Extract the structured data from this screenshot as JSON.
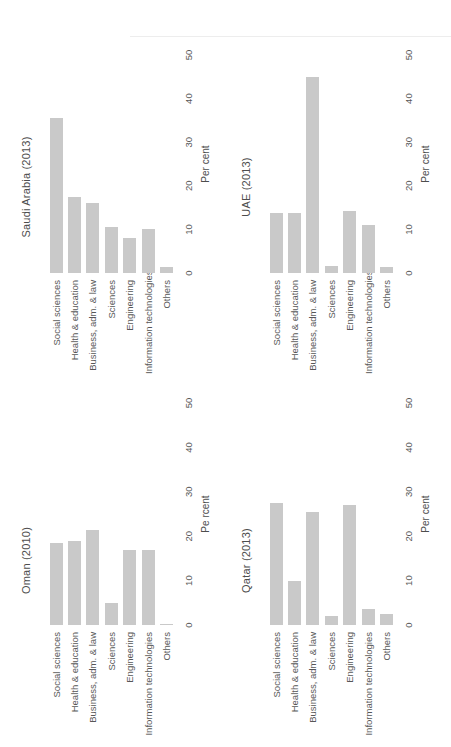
{
  "figure": {
    "bar_color": "#c9c9c9",
    "text_color": "#4d4d4d",
    "categories": [
      "Social sciences",
      "Health & education",
      "Business, adm. & law",
      "Sciences",
      "Engineering",
      "Information technologies",
      "Others"
    ]
  },
  "chart_data": [
    {
      "type": "bar",
      "orientation": "horizontal",
      "title": "Oman (2010)",
      "categories": [
        "Social sciences",
        "Health & education",
        "Business, adm. & law",
        "Sciences",
        "Engineering",
        "Information technologies",
        "Others"
      ],
      "values": [
        18.5,
        19,
        21.5,
        5,
        17,
        17,
        0.2
      ],
      "xlabel": "Pe rcent",
      "xlim": [
        0,
        50
      ],
      "xticks": [
        0,
        10,
        20,
        30,
        40,
        50
      ],
      "bar_color": "#c9c9c9",
      "grid": false,
      "legend": null
    },
    {
      "type": "bar",
      "orientation": "horizontal",
      "title": "Saudi Arabia (2013)",
      "categories": [
        "Social sciences",
        "Health & education",
        "Business, adm. & law",
        "Sciences",
        "Engineering",
        "Information technologies",
        "Others"
      ],
      "values": [
        35.5,
        17.5,
        16,
        10.5,
        8,
        10,
        1.3
      ],
      "xlabel": "Per cent",
      "xlim": [
        0,
        50
      ],
      "xticks": [
        0,
        10,
        20,
        30,
        40,
        50
      ],
      "bar_color": "#c9c9c9",
      "grid": false,
      "legend": null
    },
    {
      "type": "bar",
      "orientation": "horizontal",
      "title": "Qatar (2013)",
      "categories": [
        "Social sciences",
        "Health & education",
        "Business, adm. & law",
        "Sciences",
        "Engineering",
        "Information technologies",
        "Others"
      ],
      "values": [
        27.5,
        10,
        25.5,
        2,
        27,
        3.5,
        2.5
      ],
      "xlabel": "Per cent",
      "xlim": [
        0,
        50
      ],
      "xticks": [
        0,
        10,
        20,
        30,
        40,
        50
      ],
      "bar_color": "#c9c9c9",
      "grid": false,
      "legend": null
    },
    {
      "type": "bar",
      "orientation": "horizontal",
      "title": "UAE (2013)",
      "categories": [
        "Social sciences",
        "Health & education",
        "Business, adm. & law",
        "Sciences",
        "Engineering",
        "Information technologies",
        "Others"
      ],
      "values": [
        13.8,
        13.8,
        45,
        1.5,
        14.3,
        11,
        1.3
      ],
      "xlabel": "Per cent",
      "xlim": [
        0,
        50
      ],
      "xticks": [
        0,
        10,
        20,
        30,
        40,
        50
      ],
      "bar_color": "#c9c9c9",
      "grid": false,
      "legend": null
    }
  ]
}
